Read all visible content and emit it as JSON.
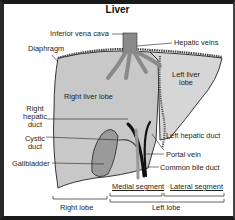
{
  "title": "Liver",
  "labels": {
    "inferior_vena_cava": "Inferior vena cava",
    "hepatic_veins": "Hepatic veins",
    "diaphragm": "Diaphragm",
    "left_liver_lobe_1": "Left liver",
    "left_liver_lobe_2": "lobe",
    "right_liver_lobe": "Right liver lobe",
    "right_hepatic_duct_1": "Right",
    "right_hepatic_duct_2": "hepatic",
    "right_hepatic_duct_3": "duct",
    "left_hepatic_duct": "Left hepatic duct",
    "cystic_duct_1": "Cystic",
    "cystic_duct_2": "duct",
    "portal_vein": "Portal vein",
    "gallbladder": "Gallbladder",
    "common_bile_duct": "Common bile duct",
    "medial_segment": "Medial segment",
    "lateral_segment": "Lateral segment",
    "right_lobe": "Right lobe",
    "left_lobe": "Left lobe"
  },
  "colors": {
    "liver_right": "#c8c8c8",
    "liver_left": "#d4d4d4",
    "vessel": "#8a8a8a",
    "gallbladder": "#9a9a9a",
    "duct_dark": "#111111",
    "outline": "#222222"
  }
}
